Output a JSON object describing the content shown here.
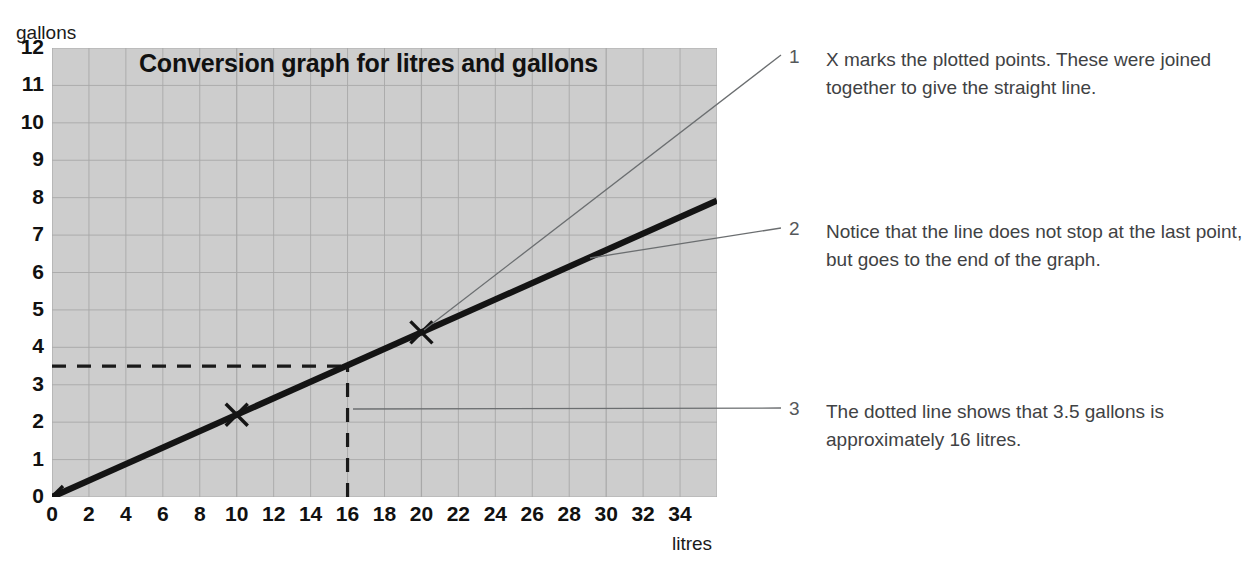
{
  "chart_data": {
    "type": "line",
    "title": "Conversion graph for litres and gallons",
    "xlabel": "litres",
    "ylabel": "gallons",
    "xlim": [
      0,
      36
    ],
    "ylim": [
      0,
      12
    ],
    "xticks": [
      0,
      2,
      4,
      6,
      8,
      10,
      12,
      14,
      16,
      18,
      20,
      22,
      24,
      26,
      28,
      30,
      32,
      34
    ],
    "yticks": [
      0,
      1,
      2,
      3,
      4,
      5,
      6,
      7,
      8,
      9,
      10,
      11,
      12
    ],
    "grid": true,
    "legend": "none",
    "series": [
      {
        "name": "litres to gallons conversion",
        "style": "solid-thick-black",
        "x": [
          0,
          36
        ],
        "y": [
          0,
          7.92
        ],
        "note": "straight line through origin, extended to the end of the graph"
      }
    ],
    "plotted_points": [
      {
        "marker": "X",
        "x": 0,
        "y": 0
      },
      {
        "marker": "X",
        "x": 10,
        "y": 2.2
      },
      {
        "marker": "X",
        "x": 20,
        "y": 4.4
      }
    ],
    "reference_lines": [
      {
        "style": "dashed",
        "orientation": "horizontal",
        "y": 3.5,
        "x_from": 0,
        "x_to": 16
      },
      {
        "style": "dashed",
        "orientation": "vertical",
        "x": 16,
        "y_from": 0,
        "y_to": 3.5
      }
    ]
  },
  "chart": {
    "title": "Conversion graph for litres and gallons",
    "y_axis_caption": "gallons",
    "x_axis_caption": "litres",
    "y_tick_labels": [
      "12",
      "11",
      "10",
      "9",
      "8",
      "7",
      "6",
      "5",
      "4",
      "3",
      "2",
      "1",
      "0"
    ],
    "x_tick_labels": [
      "0",
      "2",
      "4",
      "6",
      "8",
      "10",
      "12",
      "14",
      "16",
      "18",
      "20",
      "22",
      "24",
      "26",
      "28",
      "30",
      "32",
      "34"
    ]
  },
  "annotations": [
    {
      "number": "1",
      "text": "X marks the plotted points. These were joined together to give the straight line."
    },
    {
      "number": "2",
      "text": "Notice that the line does not stop at the last point, but goes to the end of the graph."
    },
    {
      "number": "3",
      "text": "The dotted line shows that 3.5 gallons is approximately 16 litres."
    }
  ],
  "colors": {
    "plot_background": "#cdcdcd",
    "grid_line": "#a8a8a8",
    "data_line": "#141414",
    "text": "#111111",
    "annotation_text": "#3f4244",
    "leader_line": "#6b6e70"
  }
}
